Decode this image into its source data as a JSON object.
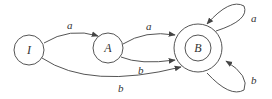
{
  "diagram": {
    "type": "finite-automaton",
    "states": [
      {
        "id": "I",
        "label": "I",
        "accepting": false
      },
      {
        "id": "A",
        "label": "A",
        "accepting": false
      },
      {
        "id": "B",
        "label": "B",
        "accepting": true
      }
    ],
    "transitions": [
      {
        "from": "I",
        "to": "A",
        "label": "a"
      },
      {
        "from": "I",
        "to": "B",
        "label": "b"
      },
      {
        "from": "A",
        "to": "B",
        "label": "a"
      },
      {
        "from": "A",
        "to": "B",
        "label": "b"
      },
      {
        "from": "B",
        "to": "B",
        "label": "a"
      },
      {
        "from": "B",
        "to": "B",
        "label": "b"
      }
    ]
  }
}
